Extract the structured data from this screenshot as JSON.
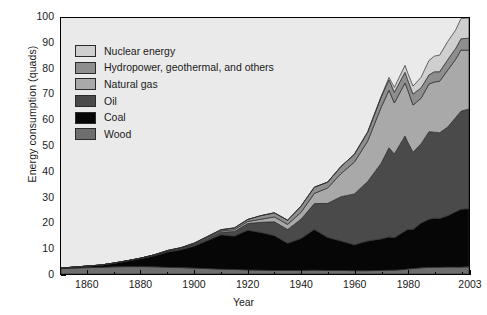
{
  "chart_data": {
    "type": "area",
    "title": "",
    "xlabel": "Year",
    "ylabel": "Energy consumption (quads)",
    "xlim": [
      1850,
      2003
    ],
    "ylim": [
      0,
      100
    ],
    "grid": false,
    "stacked": true,
    "legend_position": "upper-left-inside",
    "x_ticks": [
      "1860",
      "1880",
      "1900",
      "1920",
      "1940",
      "1960",
      "1980",
      "2003"
    ],
    "x_tick_values": [
      1860,
      1880,
      1900,
      1920,
      1940,
      1960,
      1980,
      2003
    ],
    "y_ticks": [
      "0",
      "10",
      "20",
      "30",
      "40",
      "50",
      "60",
      "70",
      "80",
      "90",
      "100"
    ],
    "y_tick_values": [
      0,
      10,
      20,
      30,
      40,
      50,
      60,
      70,
      80,
      90,
      100
    ],
    "x": [
      1850,
      1855,
      1860,
      1865,
      1870,
      1875,
      1880,
      1885,
      1890,
      1895,
      1900,
      1905,
      1910,
      1915,
      1920,
      1925,
      1930,
      1935,
      1940,
      1945,
      1950,
      1955,
      1960,
      1965,
      1970,
      1973,
      1975,
      1979,
      1980,
      1982,
      1985,
      1988,
      1990,
      1992,
      1995,
      1998,
      2000,
      2003
    ],
    "series": [
      {
        "name": "Wood",
        "color": "#6e6e6e",
        "values": [
          2.1,
          2.3,
          2.5,
          2.6,
          2.8,
          2.9,
          2.9,
          2.8,
          2.6,
          2.5,
          2.3,
          2.1,
          1.9,
          1.8,
          1.6,
          1.5,
          1.4,
          1.4,
          1.4,
          1.5,
          1.4,
          1.4,
          1.3,
          1.3,
          1.4,
          1.5,
          1.5,
          1.8,
          2.0,
          2.1,
          2.4,
          2.6,
          2.6,
          2.6,
          2.7,
          2.7,
          2.7,
          2.8
        ]
      },
      {
        "name": "Coal",
        "color": "#060606",
        "values": [
          0.2,
          0.4,
          0.6,
          0.9,
          1.4,
          2.2,
          3.1,
          4.3,
          6.0,
          7.0,
          8.6,
          11.0,
          13.4,
          13.0,
          15.5,
          14.7,
          13.6,
          10.6,
          12.5,
          15.9,
          12.9,
          11.5,
          10.1,
          11.6,
          12.3,
          13.0,
          12.7,
          15.0,
          15.4,
          15.3,
          17.5,
          18.8,
          19.2,
          19.1,
          20.1,
          21.6,
          22.6,
          22.7
        ]
      },
      {
        "name": "Oil",
        "color": "#4a4a4a",
        "values": [
          0.0,
          0.0,
          0.0,
          0.0,
          0.1,
          0.1,
          0.2,
          0.3,
          0.4,
          0.5,
          0.6,
          0.8,
          1.0,
          1.8,
          2.6,
          4.0,
          5.4,
          5.4,
          7.5,
          10.1,
          13.3,
          17.3,
          19.9,
          23.2,
          29.5,
          34.8,
          32.7,
          37.1,
          34.2,
          30.2,
          30.9,
          34.2,
          33.6,
          33.5,
          34.6,
          36.8,
          38.3,
          39.0
        ]
      },
      {
        "name": "Natural gas",
        "color": "#a9a9a9",
        "values": [
          0.0,
          0.0,
          0.0,
          0.0,
          0.0,
          0.0,
          0.0,
          0.1,
          0.1,
          0.2,
          0.3,
          0.4,
          0.5,
          0.7,
          0.8,
          1.2,
          1.9,
          2.0,
          2.7,
          4.0,
          6.0,
          9.0,
          12.4,
          15.8,
          21.8,
          22.5,
          19.9,
          20.7,
          20.4,
          18.4,
          17.8,
          18.6,
          19.6,
          20.1,
          22.2,
          22.8,
          23.9,
          22.9
        ]
      },
      {
        "name": "Hydropower, geothermal, and others",
        "color": "#8e8e8e",
        "values": [
          0.0,
          0.0,
          0.0,
          0.0,
          0.0,
          0.0,
          0.0,
          0.0,
          0.1,
          0.1,
          0.3,
          0.4,
          0.5,
          0.7,
          0.8,
          1.4,
          1.6,
          1.6,
          2.4,
          2.4,
          2.3,
          2.8,
          3.0,
          3.4,
          4.0,
          4.1,
          4.2,
          4.2,
          3.9,
          4.3,
          4.1,
          3.6,
          4.0,
          3.7,
          4.1,
          4.2,
          4.4,
          4.7
        ]
      },
      {
        "name": "Nuclear energy",
        "color": "#cfcfcf",
        "values": [
          0.0,
          0.0,
          0.0,
          0.0,
          0.0,
          0.0,
          0.0,
          0.0,
          0.0,
          0.0,
          0.0,
          0.0,
          0.0,
          0.0,
          0.0,
          0.0,
          0.0,
          0.0,
          0.0,
          0.0,
          0.0,
          0.0,
          0.1,
          0.3,
          0.2,
          0.9,
          1.9,
          2.7,
          2.7,
          3.1,
          4.1,
          5.6,
          6.1,
          6.5,
          7.1,
          7.2,
          7.9,
          7.9
        ]
      }
    ],
    "legend": [
      {
        "label": "Nuclear energy",
        "color": "#cfcfcf"
      },
      {
        "label": "Hydropower, geothermal, and others",
        "color": "#8e8e8e"
      },
      {
        "label": "Natural gas",
        "color": "#a9a9a9"
      },
      {
        "label": "Oil",
        "color": "#4a4a4a"
      },
      {
        "label": "Coal",
        "color": "#060606"
      },
      {
        "label": "Wood",
        "color": "#6e6e6e"
      }
    ],
    "colors": {
      "plot_background": "#eaeaea",
      "figure_background": "#ffffff",
      "axis": "#000000",
      "text": "#1a1a1a"
    }
  }
}
